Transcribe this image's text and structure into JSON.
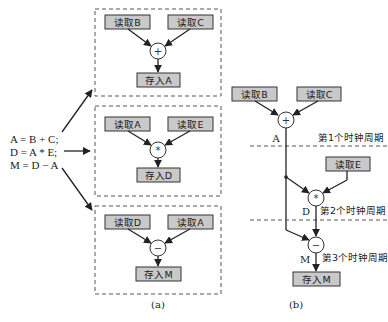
{
  "equations": [
    "A = B + C;",
    "D = A * E;",
    "M = D − A"
  ],
  "panel_a": {
    "caption": "(a)",
    "groups": [
      {
        "left": "读取B",
        "right": "读取C",
        "op": "+",
        "out": "存入A"
      },
      {
        "left": "读取A",
        "right": "读取E",
        "op": "*",
        "out": "存入D"
      },
      {
        "left": "读取D",
        "right": "读取A",
        "op": "−",
        "out": "存入M"
      }
    ]
  },
  "panel_b": {
    "caption": "(b)",
    "read_b": "读取B",
    "read_c": "读取C",
    "read_e": "读取E",
    "store_m": "存入M",
    "op1": "+",
    "op2": "*",
    "op3": "−",
    "label_a": "A",
    "label_d": "D",
    "label_m": "M",
    "cycle1": "第1个时钟周期",
    "cycle2": "第2个时钟周期",
    "cycle3": "第3个时钟周期"
  },
  "colors": {
    "box_fill": "#c9c9c9",
    "stroke": "#333333"
  }
}
